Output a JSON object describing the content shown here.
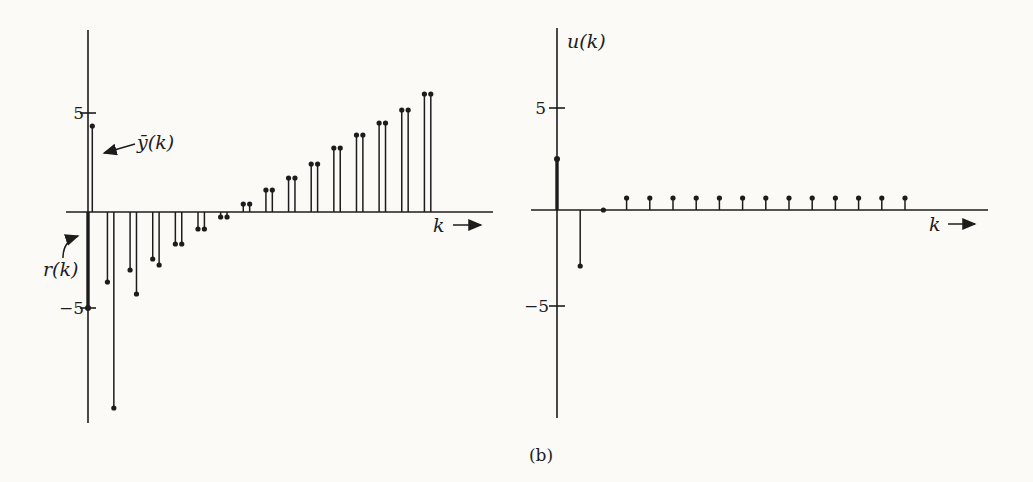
{
  "figure": {
    "caption": "(b)",
    "ink_color": "#1c1c1c",
    "paper_color": "#fbfaf7"
  },
  "left_plot": {
    "xlabel": "k",
    "ytick_pos": "5",
    "ytick_neg": "−5",
    "series_label_y": "ȳ(k)",
    "series_label_r": "r(k)"
  },
  "right_plot": {
    "title": "u(k)",
    "xlabel": "k",
    "ytick_pos": "5",
    "ytick_neg": "−5"
  },
  "chart_data": [
    {
      "type": "stem",
      "title": "",
      "xlabel": "k",
      "ylabel": "",
      "x": [
        0,
        1,
        2,
        3,
        4,
        5,
        6,
        7,
        8,
        9,
        10,
        11,
        12,
        13,
        14,
        15
      ],
      "series": [
        {
          "name": "r(k)",
          "values": [
            -4.8,
            -3.5,
            -2.9,
            -2.35,
            -1.6,
            -0.85,
            -0.25,
            0.4,
            1.1,
            1.7,
            2.4,
            3.2,
            3.85,
            4.45,
            5.1,
            5.9
          ]
        },
        {
          "name": "ȳ(k)",
          "values": [
            4.3,
            -9.8,
            -4.1,
            -2.65,
            -1.6,
            -0.85,
            -0.25,
            0.4,
            1.1,
            1.7,
            2.4,
            3.2,
            3.85,
            4.45,
            5.1,
            5.9
          ]
        }
      ],
      "yticks": [
        5,
        -5
      ],
      "ylim": [
        -10.5,
        9.1
      ],
      "grid": false,
      "legend": "annotated-arrows",
      "annotations": [
        "ȳ(k)",
        "r(k)"
      ]
    },
    {
      "type": "stem",
      "title": "u(k)",
      "xlabel": "k",
      "ylabel": "",
      "x": [
        0,
        1,
        2,
        3,
        4,
        5,
        6,
        7,
        8,
        9,
        10,
        11,
        12,
        13,
        14,
        15
      ],
      "series": [
        {
          "name": "u(k)",
          "values": [
            2.55,
            -2.8,
            0,
            0.6,
            0.6,
            0.6,
            0.6,
            0.6,
            0.6,
            0.6,
            0.6,
            0.6,
            0.6,
            0.6,
            0.6,
            0.6
          ]
        }
      ],
      "yticks": [
        5,
        -5
      ],
      "ylim": [
        -10.4,
        9.1
      ],
      "grid": false,
      "legend": "none"
    }
  ]
}
